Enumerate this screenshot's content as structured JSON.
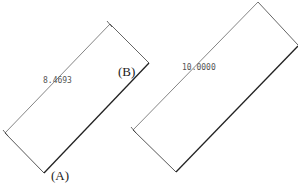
{
  "diagram": {
    "left_rect": {
      "dimension": "8.4693",
      "corner_labels": {
        "top_right": "(B)",
        "bottom": "(A)"
      }
    },
    "right_rect": {
      "dimension": "10.0000"
    },
    "colors": {
      "line": "#333333",
      "text": "#555555",
      "background": "#ffffff"
    }
  }
}
